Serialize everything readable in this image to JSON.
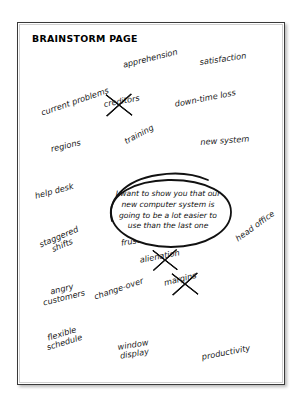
{
  "page": {
    "title": "BRAINSTORM PAGE",
    "background_color": "#ffffff",
    "sheet_color": "#ffffff",
    "border_color": "#3a3a3a",
    "ink_color": "#1a1a1a"
  },
  "speech_bubble": {
    "text": "I want to show you that our new computer system is going to be a lot easier to use than the last one",
    "shape": "hand-drawn-ellipse"
  },
  "notes": [
    {
      "label": "current problems",
      "crossed_out": false
    },
    {
      "label": "apprehension",
      "crossed_out": false
    },
    {
      "label": "satisfaction",
      "crossed_out": false
    },
    {
      "label": "creditors",
      "crossed_out": true
    },
    {
      "label": "down-time loss",
      "crossed_out": false
    },
    {
      "label": "regions",
      "crossed_out": false
    },
    {
      "label": "training",
      "crossed_out": false
    },
    {
      "label": "new system",
      "crossed_out": false
    },
    {
      "label": "help desk",
      "crossed_out": false
    },
    {
      "label": "staggered\nshifts",
      "crossed_out": false
    },
    {
      "label": "staff\nfrustration",
      "crossed_out": false
    },
    {
      "label": "head office",
      "crossed_out": false
    },
    {
      "label": "alienation",
      "crossed_out": true
    },
    {
      "label": "angry\ncustomers",
      "crossed_out": false
    },
    {
      "label": "change-over",
      "crossed_out": false
    },
    {
      "label": "margins",
      "crossed_out": true
    },
    {
      "label": "flexible\nschedule",
      "crossed_out": false
    },
    {
      "label": "window\ndisplay",
      "crossed_out": false
    },
    {
      "label": "productivity",
      "crossed_out": false
    }
  ]
}
